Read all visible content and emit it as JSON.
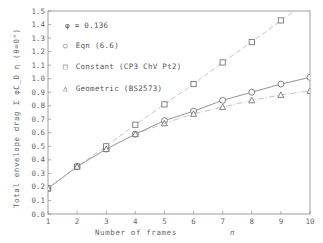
{
  "chart_data": {
    "type": "line",
    "title": "",
    "xlabel": "Number of frames",
    "xlabel_symbol": "n",
    "ylabel": "Total envelope drag",
    "ylabel_formula": "Σ φ C_D η (θ=0°)",
    "annotation": "φ = 0.136",
    "xlim": [
      1,
      10
    ],
    "ylim": [
      0.0,
      1.5
    ],
    "x_ticks": [
      1,
      2,
      3,
      4,
      5,
      6,
      7,
      8,
      9,
      10
    ],
    "y_ticks": [
      "0.0",
      "0.1",
      "0.2",
      "0.3",
      "0.4",
      "0.5",
      "0.6",
      "0.7",
      "0.8",
      "0.9",
      "1.0",
      "1.1",
      "1.2",
      "1.3",
      "1.4",
      "1.5"
    ],
    "grid": false,
    "legend_position": "upper-left",
    "x": [
      1,
      2,
      3,
      4,
      5,
      6,
      7,
      8,
      9,
      10
    ],
    "series": [
      {
        "name": "Eqn (6.6)",
        "marker": "circle",
        "line": "solid",
        "values": [
          0.19,
          0.35,
          0.48,
          0.59,
          0.69,
          0.76,
          0.84,
          0.9,
          0.96,
          1.01
        ]
      },
      {
        "name": "Constant (CP3 ChV Pt2)",
        "marker": "square",
        "line": "dashed",
        "values": [
          0.19,
          0.35,
          0.5,
          0.66,
          0.81,
          0.96,
          1.12,
          1.27,
          1.43,
          1.58
        ]
      },
      {
        "name": "Geometric (BS2573)",
        "marker": "triangle",
        "line": "dash-dot",
        "values": [
          0.19,
          0.35,
          0.48,
          0.59,
          0.67,
          0.74,
          0.79,
          0.84,
          0.88,
          0.91
        ]
      }
    ]
  },
  "legend": {
    "annotation": "φ = 0.136",
    "items": [
      {
        "symbol": "○",
        "label": "Eqn (6.6)"
      },
      {
        "symbol": "□",
        "label": "Constant (CP3 ChV Pt2)"
      },
      {
        "symbol": "△",
        "label": "Geometric (BS2573)"
      }
    ]
  },
  "axes": {
    "xlabel": "Number of frames",
    "xsymbol": "n",
    "ylabel": "Total envelope drag",
    "yformula": "Σ φC_D η (θ=0°)"
  },
  "colors": {
    "axis": "#888888",
    "series_line": "#777777",
    "dashed_line": "#b5b5b5",
    "marker": "#666666"
  }
}
